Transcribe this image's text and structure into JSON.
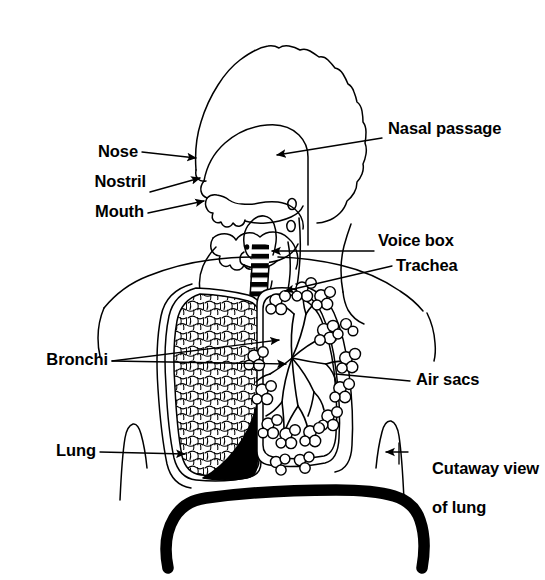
{
  "figure": {
    "type": "anatomical-line-diagram",
    "ink_color": "#000000",
    "background_color": "#ffffff"
  },
  "labels": {
    "nose": "Nose",
    "nostril": "Nostril",
    "mouth": "Mouth",
    "bronchi": "Bronchi",
    "lung": "Lung",
    "nasal_passage": "Nasal passage",
    "voice_box": "Voice box",
    "trachea": "Trachea",
    "air_sacs": "Air sacs",
    "cutaway_line1": "Cutaway view",
    "cutaway_line2": "of lung"
  },
  "parts": {
    "head": "head-profile",
    "nasal_cavity": "nasal-cavity",
    "palate": "hard-palate",
    "tongue": "tongue",
    "jaw": "jaw-outline",
    "larynx": "voice-box",
    "trachea": "trachea-cartilage-rings",
    "bronchus_left": "left-bronchus",
    "bronchus_right": "right-bronchus",
    "lung_left": "left-lung-stippled",
    "lung_right": "right-lung-cutaway",
    "bronchial_tree": "bronchial-tree",
    "alveoli": "alveolar-clusters",
    "diaphragm": "diaphragm",
    "torso": "torso-outline",
    "bracket_left": "body-outline-bracket-left",
    "bracket_right": "body-outline-bracket-right"
  }
}
